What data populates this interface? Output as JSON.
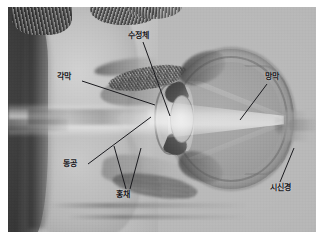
{
  "figure": {
    "kind": "photographic-anatomy-illustration",
    "palette": {
      "paper": "#ffffff",
      "plate_base": "#b9b8b4",
      "label_text": "#16161a",
      "leader_line": "#1a1a1e",
      "ray_highlight": "#ffffff",
      "hair_dark": "#2e2d2a",
      "globe_mid": "#9a9893"
    }
  },
  "labels": [
    {
      "id": "lens",
      "text": "수정체",
      "position": "top-center",
      "points_to": "crystalline-lens"
    },
    {
      "id": "cornea",
      "text": "각막",
      "position": "upper-left",
      "points_to": "cornea-front-surface"
    },
    {
      "id": "retina",
      "text": "망막",
      "position": "upper-right",
      "points_to": "retina-inner-back-wall"
    },
    {
      "id": "pupil",
      "text": "동공",
      "position": "lower-left",
      "points_to": "pupil-aperture"
    },
    {
      "id": "iris",
      "text": "홍채",
      "position": "bottom-center",
      "points_to": "iris-upper-and-lower-leaf"
    },
    {
      "id": "optic-nerve",
      "text": "시신경",
      "position": "lower-right",
      "points_to": "optic-nerve-head"
    }
  ]
}
